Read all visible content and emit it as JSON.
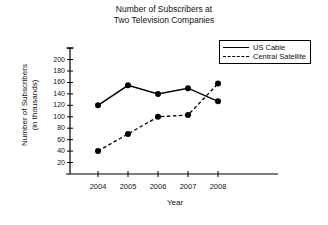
{
  "chart_data": {
    "type": "line",
    "title": "Number of Subscribers at Two Television Companies",
    "title_line1": "Number of Subscribers at",
    "title_line2": "Two Television Companies",
    "xlabel": "Year",
    "ylabel": "Number of Subscribers (in thousands)",
    "ylabel_line1": "Number of Subscribers",
    "ylabel_line2": "(in thousands)",
    "categories": [
      "2004",
      "2005",
      "2006",
      "2007",
      "2008"
    ],
    "yticks": [
      20,
      40,
      60,
      80,
      100,
      120,
      140,
      160,
      180,
      200
    ],
    "ytick_labels": [
      "20",
      "40",
      "60",
      "80",
      "100",
      "120",
      "140",
      "160",
      "180",
      "200"
    ],
    "ylim": [
      0,
      240
    ],
    "grid": false,
    "legend_position": "top-right",
    "series": [
      {
        "name": "US Cable",
        "style": "solid",
        "color": "#000000",
        "values": [
          120,
          155,
          140,
          150,
          127
        ]
      },
      {
        "name": "Central Satellite",
        "style": "dashed",
        "color": "#000000",
        "values": [
          40,
          70,
          100,
          103,
          158
        ]
      }
    ]
  },
  "legend": {
    "items": [
      {
        "label": "US Cable",
        "style": "solid"
      },
      {
        "label": "Central Satellite",
        "style": "dashed"
      }
    ]
  }
}
